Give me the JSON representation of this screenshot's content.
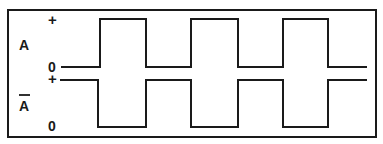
{
  "diagram": {
    "type": "timing-diagram",
    "frame": {
      "x": 8,
      "y": 10,
      "width": 368,
      "height": 127,
      "stroke": "#1a1a1a"
    },
    "signals": [
      {
        "name": "A",
        "label": "A",
        "overbar": false,
        "high_label": "+",
        "low_label": "0",
        "high_y": 19,
        "low_y": 67,
        "initial_level": "low",
        "start_x": 61,
        "end_x": 367,
        "transitions_x": [
          100,
          146,
          191,
          238,
          283,
          328
        ]
      },
      {
        "name": "A-bar",
        "label": "A",
        "overbar": true,
        "high_label": "+",
        "low_label": "0",
        "high_y": 80,
        "low_y": 127,
        "initial_level": "high",
        "start_x": 60,
        "end_x": 367,
        "transitions_x": [
          98,
          146,
          191,
          238,
          283,
          328
        ]
      }
    ],
    "colors": {
      "line": "#1a1a1a",
      "background": "#ffffff"
    }
  }
}
